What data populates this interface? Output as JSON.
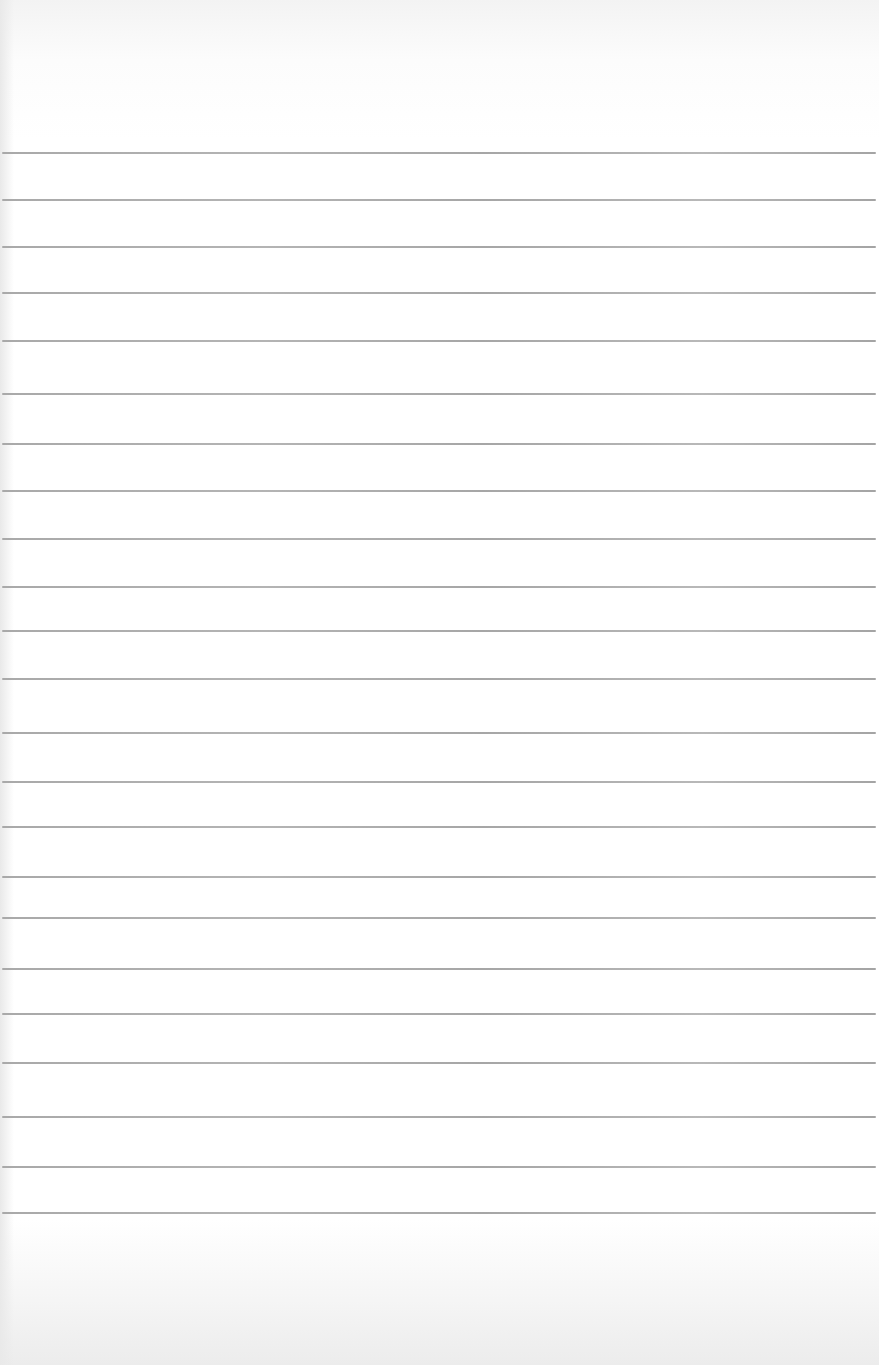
{
  "paper": {
    "type": "lined-paper",
    "background_color": "#ffffff",
    "rule_color": "#aaaaaa",
    "rule_positions_y": [
      152,
      199,
      246,
      292,
      340,
      393,
      443,
      490,
      538,
      586,
      630,
      678,
      732,
      781,
      826,
      876,
      917,
      968,
      1013,
      1062,
      1116,
      1166,
      1212
    ]
  }
}
